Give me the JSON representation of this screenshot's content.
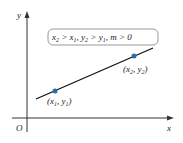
{
  "diagram": {
    "axes": {
      "x_label": "x",
      "y_label": "y",
      "origin_label": "O"
    },
    "condition_box": {
      "text": "x2 > x1, y2 > y1, m > 0",
      "parts": [
        "x",
        "2",
        " > x",
        "1",
        ", y",
        "2",
        " > y",
        "1",
        ", m > 0"
      ]
    },
    "points": [
      {
        "label": "(x1, y1)",
        "name": "x",
        "sub": "1",
        "name2": "y",
        "sub2": "1",
        "color": "#2a6db5"
      },
      {
        "label": "(x2, y2)",
        "name": "x",
        "sub": "2",
        "name2": "y",
        "sub2": "2",
        "color": "#2a6db5"
      }
    ],
    "line_color": "#111111"
  }
}
